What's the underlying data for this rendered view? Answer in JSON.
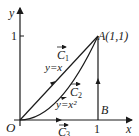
{
  "diagram": {
    "axes": {
      "x_label": "x",
      "y_label": "y",
      "origin_label": "O",
      "x_tick": "1",
      "y_tick": "1"
    },
    "points": {
      "A": "A(1,1)",
      "B": "B"
    },
    "paths": [
      {
        "name": "C1",
        "label": "C",
        "subscript": "1",
        "equation": "y=x",
        "from": "O",
        "to": "A"
      },
      {
        "name": "C2",
        "label": "C",
        "subscript": "2",
        "equation": "y=x²",
        "from": "O",
        "to": "A"
      },
      {
        "name": "C3",
        "label": "C",
        "subscript": "3",
        "from": "O",
        "to": "B",
        "then": "A"
      }
    ],
    "colors": {
      "stroke": "#1a1a1a",
      "background": "#ffffff"
    }
  }
}
